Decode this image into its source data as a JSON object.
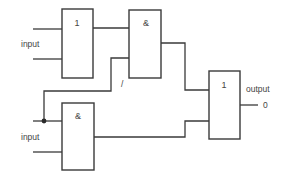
{
  "diagram": {
    "type": "logic-circuit",
    "colors": {
      "line": "#3a3a3a",
      "text": "#444444",
      "background": "#ffffff"
    },
    "gates": [
      {
        "id": "or-top",
        "symbol": "1",
        "kind": "OR"
      },
      {
        "id": "and-top",
        "symbol": "&",
        "kind": "AND"
      },
      {
        "id": "and-bottom",
        "symbol": "&",
        "kind": "AND"
      },
      {
        "id": "or-output",
        "symbol": "1",
        "kind": "OR"
      }
    ],
    "labels": {
      "input_top": "input",
      "input_bottom": "input",
      "output": "output",
      "output_value": "0",
      "feedback_mark": "/"
    }
  }
}
